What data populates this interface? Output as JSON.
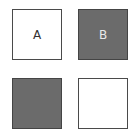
{
  "tiles": [
    {
      "id": "top-left",
      "label": "A",
      "fill": "#ffffff",
      "text_color": "#333333"
    },
    {
      "id": "top-right",
      "label": "B",
      "fill": "#6b6b6b",
      "text_color": "#e8e8e8"
    },
    {
      "id": "bottom-left",
      "label": "",
      "fill": "#6b6b6b"
    },
    {
      "id": "bottom-right",
      "label": "",
      "fill": "#ffffff"
    }
  ]
}
